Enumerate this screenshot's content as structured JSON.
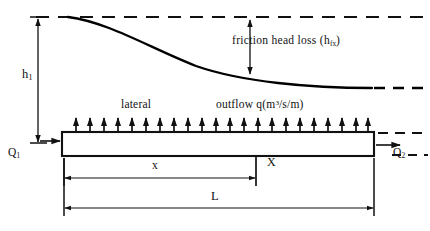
{
  "figure": {
    "type": "engineering-schematic"
  },
  "labels": {
    "friction_head_loss": "friction head loss (h",
    "friction_head_loss_sub": "fx",
    "friction_head_loss_close": ")",
    "total_head": "h",
    "total_head_sub": "1",
    "lateral": "lateral",
    "outflow_prefix": "outflow q(m",
    "outflow_sup": "3",
    "outflow_suffix": "/s/m)",
    "inflow": "Q",
    "inflow_sub": "1",
    "discharge": "Q",
    "discharge_sub": "2",
    "distance_x": "x",
    "section_X": "X",
    "length_L": "L"
  },
  "colors": {
    "line": "#111111",
    "background": "#ffffff",
    "curve": "#000000"
  },
  "geometry": {
    "datum_y": 17,
    "pipe_top_y": 132,
    "pipe_bottom_y": 156,
    "pipe_left_x": 62,
    "pipe_right_x": 374,
    "curve_start_x": 68,
    "curve_end_x": 372,
    "curve_end_y": 87,
    "section_x": 256,
    "arrow_count": 22,
    "dim_x_y": 178,
    "dim_L_y": 208
  }
}
